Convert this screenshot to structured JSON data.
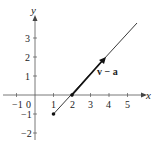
{
  "diagram": {
    "axes": {
      "x_label": "x",
      "y_label": "y"
    },
    "x_ticks": [
      "−1",
      "0",
      "1",
      "2",
      "3",
      "4",
      "5"
    ],
    "y_ticks": [
      "3",
      "2",
      "1",
      "−1",
      "−2"
    ],
    "vector_label": "v − a",
    "points": [
      [
        1,
        -1
      ],
      [
        2,
        0
      ],
      [
        3.75,
        2
      ]
    ],
    "line": {
      "from": [
        1,
        -1
      ],
      "to": [
        5.5,
        3.8
      ]
    },
    "colors": {
      "ink": "#222222",
      "axis": "#555555"
    }
  }
}
